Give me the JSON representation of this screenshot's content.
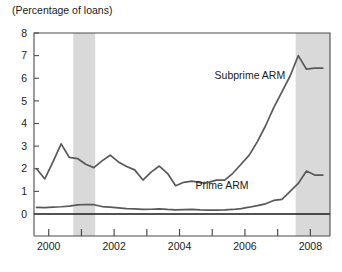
{
  "chart_data": {
    "type": "line",
    "title": "(Percentage of loans)",
    "xlabel": "",
    "ylabel": "(Percentage of loans)",
    "xlim": [
      1999.55,
      2008.6
    ],
    "ylim": [
      0,
      8
    ],
    "ytick_values": [
      0,
      1,
      2,
      3,
      4,
      5,
      6,
      7,
      8
    ],
    "ytick_labels": [
      "0",
      "1",
      "2",
      "3",
      "4",
      "5",
      "6",
      "7",
      "8"
    ],
    "xtick_major_values": [
      2000,
      2002,
      2004,
      2006,
      2008
    ],
    "xtick_major_labels": [
      "2000",
      "2002",
      "2004",
      "2006",
      "2008"
    ],
    "xtick_minor_values": [
      2001,
      2003,
      2005,
      2007
    ],
    "grid": false,
    "legend_position": "inline-annotations",
    "annotations": [
      {
        "text": "Subprime ARM",
        "x": 2006.15,
        "y": 5.95
      },
      {
        "text": "Prime ARM",
        "x": 2005.3,
        "y": 1.1
      }
    ],
    "shaded_bands": [
      {
        "label": "recession-band-1",
        "x_start": 2000.75,
        "x_end": 2001.42,
        "color": "#d9d9d9"
      },
      {
        "label": "recession-band-2",
        "x_start": 2007.55,
        "x_end": 2008.6,
        "color": "#d9d9d9"
      }
    ],
    "series": [
      {
        "name": "Subprime ARM",
        "color": "#595959",
        "x": [
          1999.63,
          1999.88,
          2000.13,
          2000.38,
          2000.63,
          2000.88,
          2001.13,
          2001.38,
          2001.63,
          2001.88,
          2002.13,
          2002.38,
          2002.63,
          2002.88,
          2003.13,
          2003.38,
          2003.63,
          2003.88,
          2004.13,
          2004.38,
          2004.63,
          2004.88,
          2005.13,
          2005.38,
          2005.63,
          2005.88,
          2006.13,
          2006.38,
          2006.63,
          2006.88,
          2007.13,
          2007.38,
          2007.63,
          2007.88,
          2008.13,
          2008.38
        ],
        "values": [
          2.0,
          1.55,
          2.3,
          3.1,
          2.5,
          2.45,
          2.2,
          2.05,
          2.35,
          2.6,
          2.3,
          2.1,
          1.95,
          1.5,
          1.85,
          2.12,
          1.8,
          1.25,
          1.4,
          1.45,
          1.38,
          1.4,
          1.5,
          1.5,
          1.8,
          2.2,
          2.6,
          3.2,
          3.9,
          4.7,
          5.4,
          6.1,
          7.0,
          6.4,
          6.45,
          6.45
        ]
      },
      {
        "name": "Prime ARM",
        "color": "#595959",
        "x": [
          1999.63,
          1999.88,
          2000.13,
          2000.38,
          2000.63,
          2000.88,
          2001.13,
          2001.38,
          2001.63,
          2001.88,
          2002.13,
          2002.38,
          2002.63,
          2002.88,
          2003.13,
          2003.38,
          2003.63,
          2003.88,
          2004.13,
          2004.38,
          2004.63,
          2004.88,
          2005.13,
          2005.38,
          2005.63,
          2005.88,
          2006.13,
          2006.38,
          2006.63,
          2006.88,
          2007.13,
          2007.38,
          2007.63,
          2007.88,
          2008.13,
          2008.38
        ],
        "values": [
          0.29,
          0.28,
          0.3,
          0.32,
          0.35,
          0.4,
          0.42,
          0.41,
          0.33,
          0.3,
          0.27,
          0.24,
          0.23,
          0.2,
          0.21,
          0.23,
          0.2,
          0.18,
          0.19,
          0.2,
          0.18,
          0.17,
          0.17,
          0.18,
          0.2,
          0.24,
          0.3,
          0.37,
          0.45,
          0.6,
          0.65,
          1.0,
          1.35,
          1.9,
          1.72,
          1.72
        ]
      }
    ]
  }
}
